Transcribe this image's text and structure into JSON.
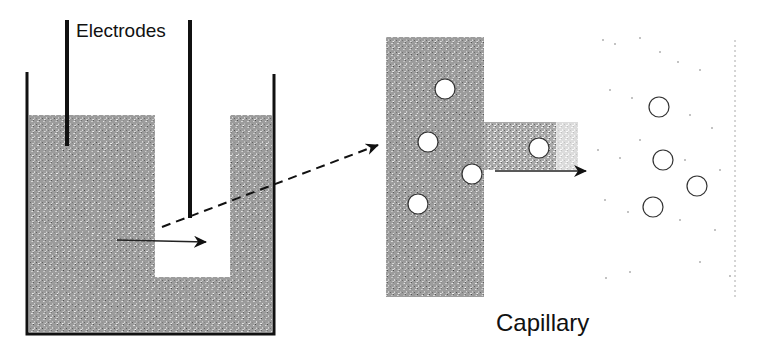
{
  "labels": {
    "electrodes": "Electrodes",
    "capillary": "Capillary"
  },
  "colors": {
    "ink": "#111111",
    "fill_gray": "#8a8a8a",
    "background": "#ffffff"
  },
  "components": {
    "beaker": {
      "left": 27,
      "right": 274,
      "top": 72,
      "bottom": 334
    },
    "liquid_top": 115,
    "u_gap": {
      "left": 155,
      "right": 230,
      "bottom": 277
    },
    "electrodes": [
      {
        "x": 67,
        "y1": 20,
        "y2": 146
      },
      {
        "x": 190,
        "y1": 20,
        "y2": 218
      }
    ],
    "capillary_block": {
      "x": 386,
      "y": 37,
      "w": 98,
      "h": 260
    },
    "capillary_channel": {
      "x": 484,
      "y": 122,
      "w": 88,
      "h": 48
    },
    "particles_in_block": [
      [
        445,
        89
      ],
      [
        428,
        142
      ],
      [
        472,
        174
      ],
      [
        418,
        204
      ],
      [
        539,
        148
      ]
    ],
    "particles_free": [
      [
        659,
        107
      ],
      [
        663,
        160
      ],
      [
        697,
        186
      ],
      [
        653,
        207
      ]
    ]
  }
}
